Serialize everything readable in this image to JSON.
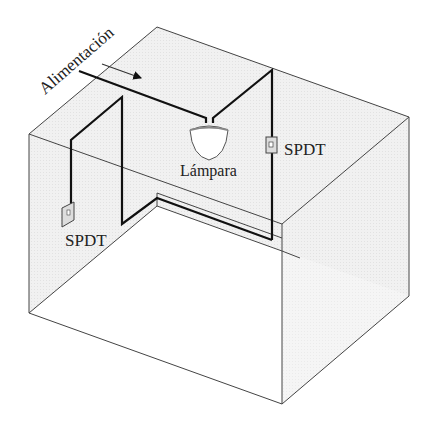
{
  "diagram": {
    "labels": {
      "power": "Alimentación",
      "lamp": "Lámpara",
      "switch_right": "SPDT",
      "switch_left": "SPDT"
    },
    "colors": {
      "wall_fill": "#efefef",
      "floor_fill": "#ffffff",
      "edge": "#444444",
      "wire": "#111111",
      "text": "#222222"
    },
    "components": [
      {
        "id": "power-feed",
        "type": "supply",
        "label": "Alimentación"
      },
      {
        "id": "lamp",
        "type": "lamp",
        "label": "Lámpara"
      },
      {
        "id": "switch-right",
        "type": "switch",
        "label": "SPDT"
      },
      {
        "id": "switch-left",
        "type": "switch",
        "label": "SPDT"
      }
    ]
  }
}
